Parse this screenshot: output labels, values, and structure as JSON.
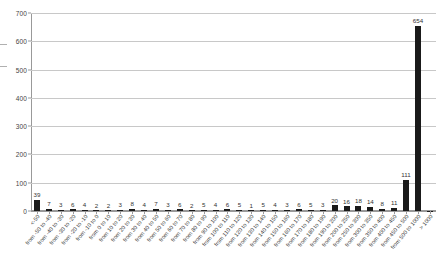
{
  "chart_data": {
    "type": "bar",
    "title": "",
    "subtitle": "",
    "xlabel": "",
    "ylabel": "",
    "ylim": [
      0,
      700
    ],
    "ytick_step": 100,
    "yticks": [
      0,
      100,
      200,
      300,
      400,
      500,
      600,
      700
    ],
    "grid": true,
    "grid_axis": "y",
    "legend": false,
    "bar_color": "#1a1a1a",
    "grid_color": "#c8c8c8",
    "axis_color": "#999999",
    "data_labels": true,
    "categories": [
      "<-50",
      "from -50 to -40",
      "from -40 to -30",
      "from -30 to -20",
      "from -20 to -10",
      "from -10 to 0",
      "from 0 to 10",
      "from 10 to 20",
      "from 20 to 30",
      "from 30 to 40",
      "from 40 to 50",
      "from 50 to 60",
      "from 60 to 70",
      "from 70 to 80",
      "from 80 to 90",
      "from 90 to 100",
      "from 100 to 110",
      "from 110 to 120",
      "from 120 to 130",
      "from 130 to 140",
      "from 140 to 150",
      "from 150 to 160",
      "from 160 to 170",
      "from 170 to 180",
      "from 180 to 190",
      "from 190 to 200",
      "from 200 to 250",
      "from 250 to 300",
      "from 300 to 350",
      "from 350 to 400",
      "from 400 to 450",
      "from 450 to 500",
      "from 500 to 1000",
      "> 1000"
    ],
    "values": [
      39,
      7,
      3,
      6,
      4,
      2,
      2,
      3,
      8,
      4,
      7,
      3,
      6,
      2,
      5,
      4,
      6,
      5,
      1,
      5,
      4,
      3,
      6,
      5,
      3,
      20,
      16,
      18,
      14,
      8,
      11,
      111,
      654,
      0
    ]
  }
}
